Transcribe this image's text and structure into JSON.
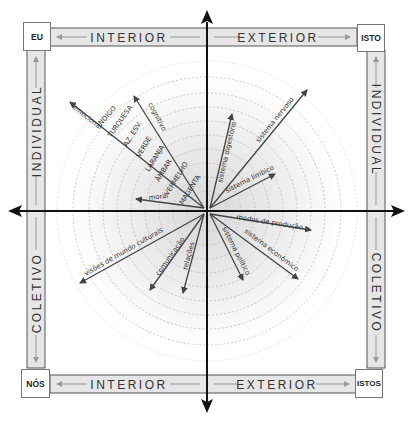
{
  "corners": {
    "top_left": "EU",
    "top_right": "ISTO",
    "bottom_left": "NÓS",
    "bottom_right": "ISTOS"
  },
  "bars": {
    "top_left": "INTERIOR",
    "top_right": "EXTERIOR",
    "bottom_left": "INTERIOR",
    "bottom_right": "EXTERIOR",
    "left_top": "INDIVIDUAL",
    "left_bottom": "COLETIVO",
    "right_top": "INDIVIDUAL",
    "right_bottom": "COLETIVO"
  },
  "quadrant_upper_left": {
    "lines": [
      "emocional",
      "cognitivo",
      "moral"
    ],
    "levels": [
      "INDIGO",
      "TURQUESA",
      "AZ. ESV.",
      "VERDE",
      "LARANJA",
      "ÂMBAR",
      "VERMELHO",
      "MAGENTA"
    ]
  },
  "quadrant_upper_right": {
    "lines": [
      "sistema digestório",
      "sistema nervoso",
      "sistema límbico"
    ]
  },
  "quadrant_lower_left": {
    "lines": [
      "visões de mundo culturais",
      "comunicação",
      "relações"
    ]
  },
  "quadrant_lower_right": {
    "lines": [
      "modos de produção",
      "sistema econômico",
      "sistema político"
    ]
  },
  "colors": {
    "bar_fill": "#e6e6e6",
    "bar_border": "#555555",
    "axis": "#111111",
    "vector": "#444444",
    "ring": "#bbbbbb",
    "inner_fill": "#e9e9e9"
  }
}
